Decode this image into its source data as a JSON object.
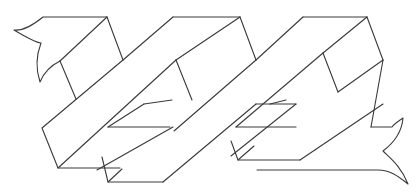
{
  "figure": {
    "stroke_color": "#3a3a3a",
    "background": "#ffffff",
    "parts": [
      {
        "name": "left-tail"
      },
      {
        "name": "band-1"
      },
      {
        "name": "band-2"
      },
      {
        "name": "band-3"
      },
      {
        "name": "right-tail"
      }
    ]
  }
}
